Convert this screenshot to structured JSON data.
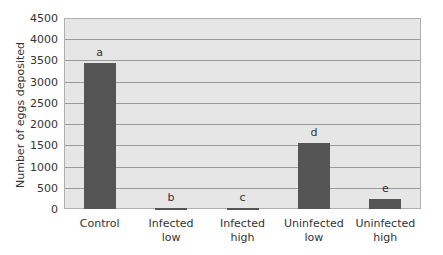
{
  "chart_data": {
    "type": "bar",
    "title": "",
    "xlabel": "",
    "ylabel": "Number of eggs deposited",
    "ylim": [
      0,
      4500
    ],
    "yticks": [
      0,
      500,
      1000,
      1500,
      2000,
      2500,
      3000,
      3500,
      4000,
      4500
    ],
    "grid": true,
    "categories": [
      "Control",
      "Infected low",
      "Infected high",
      "Uninfected low",
      "Uninfected high"
    ],
    "category_lines": [
      [
        "Control"
      ],
      [
        "Infected",
        "low"
      ],
      [
        "Infected",
        "high"
      ],
      [
        "Uninfected",
        "low"
      ],
      [
        "Uninfected",
        "high"
      ]
    ],
    "values": [
      3450,
      20,
      25,
      1560,
      240
    ],
    "significance_labels": [
      "a",
      "b",
      "c",
      "d",
      "e"
    ],
    "bar_color": "#555555",
    "plot_background": "#e6e6e6"
  }
}
